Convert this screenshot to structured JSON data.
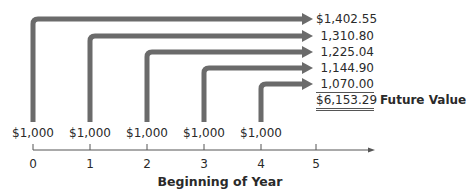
{
  "colors": {
    "arrow": "#6b6b6b",
    "axis": "#555555",
    "text": "#2a2a2a"
  },
  "deposits": [
    {
      "year": "0",
      "amount": "$1,000",
      "future_value": "$1,402.55"
    },
    {
      "year": "1",
      "amount": "$1,000",
      "future_value": "1,310.80"
    },
    {
      "year": "2",
      "amount": "$1,000",
      "future_value": "1,225.04"
    },
    {
      "year": "3",
      "amount": "$1,000",
      "future_value": "1,144.90"
    },
    {
      "year": "4",
      "amount": "$1,000",
      "future_value": "1,070.00"
    }
  ],
  "total": {
    "value": "$6,153.29",
    "label": "Future Value"
  },
  "axis": {
    "ticks": [
      "0",
      "1",
      "2",
      "3",
      "4",
      "5"
    ],
    "title": "Beginning of Year"
  }
}
